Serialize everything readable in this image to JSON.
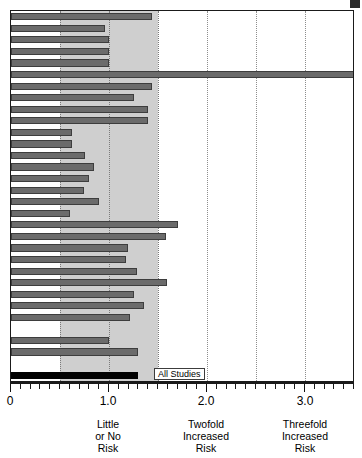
{
  "chart_data": {
    "type": "bar",
    "title": "",
    "subtitle": "",
    "xlabel": "",
    "ylabel": "",
    "orientation": "horizontal",
    "xlim": [
      0,
      3.51
    ],
    "grid": true,
    "gridlines": [
      0.5,
      1.0,
      1.5,
      2.0,
      2.5,
      3.0,
      3.5
    ],
    "shaded_band": [
      0.5,
      1.5
    ],
    "legend": "none",
    "tick_values": [
      0,
      1.0,
      2.0,
      3.0
    ],
    "tick_labels": [
      "0",
      "1.0",
      "2.0",
      "3.0"
    ],
    "minor_tick_step": 0.1,
    "category_labels": [
      {
        "at": 1.0,
        "lines": [
          "Little",
          "or No",
          "Risk"
        ]
      },
      {
        "at": 2.0,
        "lines": [
          "Twofold",
          "Increased",
          "Risk"
        ]
      },
      {
        "at": 3.0,
        "lines": [
          "Threefold",
          "Increased",
          "Risk"
        ]
      }
    ],
    "bar_colors": {
      "study": "#6b6b6b",
      "study_edge": "#3d3d3d",
      "summary": "#000000"
    },
    "annotations": [
      {
        "text": "All Studies",
        "at_value": 1.47,
        "row": 31,
        "boxed": true
      }
    ],
    "categories": [
      "Study 1",
      "Study 2",
      "Study 3",
      "Study 4",
      "Study 5",
      "Study 6",
      "Study 7",
      "Study 8",
      "Study 9",
      "Study 10",
      "Study 11",
      "Study 12",
      "Study 13",
      "Study 14",
      "Study 15",
      "Study 16",
      "Study 17",
      "Study 18",
      "Study 19",
      "Study 20",
      "Study 21",
      "Study 22",
      "Study 23",
      "Study 24",
      "Study 25",
      "Study 26",
      "Study 27",
      "Study 28",
      "Study 29",
      "Study 30",
      "(blank)",
      "All Studies"
    ],
    "values": [
      1.44,
      0.96,
      1.0,
      1.0,
      1.0,
      3.55,
      1.44,
      1.26,
      1.4,
      1.4,
      0.62,
      0.62,
      0.75,
      0.85,
      0.8,
      0.74,
      0.9,
      0.6,
      1.7,
      1.58,
      1.19,
      1.17,
      1.29,
      1.59,
      1.25,
      1.36,
      1.21,
      0.0,
      1.0,
      1.3,
      null,
      1.3
    ],
    "series_note": "Relative risk per study; final black bar is pooled estimate labeled All Studies",
    "value_overflow_index": 5
  },
  "axis": {
    "zero_label": "0",
    "one_label": "1.0",
    "two_label": "2.0",
    "three_label": "3.0"
  },
  "labels": {
    "little_l1": "Little",
    "little_l2": "or No",
    "little_l3": "Risk",
    "twofold_l1": "Twofold",
    "twofold_l2": "Increased",
    "twofold_l3": "Risk",
    "threefold_l1": "Threefold",
    "threefold_l2": "Increased",
    "threefold_l3": "Risk",
    "all_studies": "All Studies"
  }
}
